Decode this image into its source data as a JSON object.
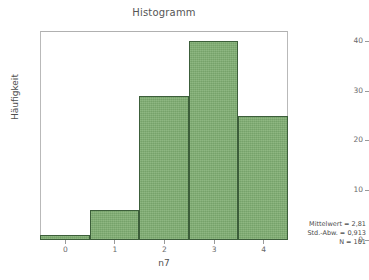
{
  "chart_data": {
    "type": "bar",
    "title": "Histogramm",
    "xlabel": "n7",
    "ylabel": "Häufigkeit",
    "categories": [
      "0",
      "1",
      "2",
      "3",
      "4"
    ],
    "values": [
      1,
      6,
      29,
      40,
      25
    ],
    "x": [
      0,
      1,
      2,
      3,
      4
    ],
    "xlim": [
      -0.5,
      4.5
    ],
    "ylim": [
      0,
      42
    ],
    "ytick_labels": [
      "0",
      "10",
      "20",
      "30",
      "40"
    ],
    "ytick_values": [
      0,
      10,
      20,
      30,
      40
    ],
    "xtick_labels": [
      "0",
      "1",
      "2",
      "3",
      "4"
    ],
    "xtick_values": [
      0,
      1,
      2,
      3,
      4
    ],
    "grid": false,
    "legend": "none",
    "bar_fill_color": "#7fae72",
    "bar_edge_color": "#3c5e3a",
    "frame_color": "#b9b9b9",
    "background_color": "#ffffff",
    "annotations": [
      "Mittelwert = 2,81",
      "Std.-Abw. = 0,913",
      "N = 101"
    ]
  },
  "stats": {
    "mean_line": "Mittelwert = 2,81",
    "sd_line": "Std.-Abw. = 0,913",
    "n_line": "N = 101"
  }
}
